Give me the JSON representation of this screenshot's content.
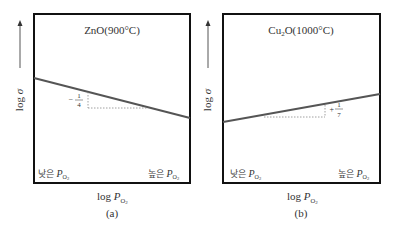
{
  "panels": [
    {
      "id": "a",
      "title_formula": "ZnO",
      "title_temp": "(900°C)",
      "y_label_log": "log",
      "y_label_sym": "σ",
      "slope_sign": "−",
      "slope_num": "1",
      "slope_den": "4",
      "low_label": "낮은",
      "high_label": "높은",
      "p_symbol": "P",
      "p_sub": "O",
      "p_sub2": "2",
      "x_label_log": "log",
      "caption": "(a)"
    },
    {
      "id": "b",
      "title_formula_main": "Cu",
      "title_formula_sub": "2",
      "title_formula_end": "O",
      "title_temp": "(1000°C)",
      "y_label_log": "log",
      "y_label_sym": "σ",
      "slope_sign": "+",
      "slope_num": "1",
      "slope_den": "7",
      "low_label": "낮은",
      "high_label": "높은",
      "p_symbol": "P",
      "p_sub": "O",
      "p_sub2": "2",
      "x_label_log": "log",
      "caption": "(b)"
    }
  ],
  "colors": {
    "frame": "#111111",
    "line": "#555555",
    "dash": "#888888",
    "arrow": "#555555"
  }
}
